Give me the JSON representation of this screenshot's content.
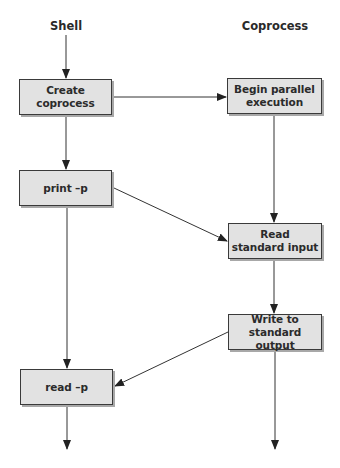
{
  "diagram": {
    "columns": [
      {
        "id": "shell",
        "label": "Shell"
      },
      {
        "id": "coprocess",
        "label": "Coprocess"
      }
    ],
    "nodes": [
      {
        "id": "create",
        "column": "shell",
        "label": "Create\ncoprocess"
      },
      {
        "id": "begin",
        "column": "coprocess",
        "label": "Begin parallel\nexecution"
      },
      {
        "id": "print",
        "column": "shell",
        "label": "print –p"
      },
      {
        "id": "readin",
        "column": "coprocess",
        "label": "Read\nstandard input"
      },
      {
        "id": "writeout",
        "column": "coprocess",
        "label": "Write to\nstandard output"
      },
      {
        "id": "read",
        "column": "shell",
        "label": "read –p"
      }
    ],
    "edges": [
      {
        "from": "shell-start",
        "to": "create"
      },
      {
        "from": "create",
        "to": "begin"
      },
      {
        "from": "create",
        "to": "print"
      },
      {
        "from": "begin",
        "to": "readin"
      },
      {
        "from": "print",
        "to": "readin"
      },
      {
        "from": "print",
        "to": "read"
      },
      {
        "from": "readin",
        "to": "writeout"
      },
      {
        "from": "writeout",
        "to": "read"
      },
      {
        "from": "read",
        "to": "shell-end"
      },
      {
        "from": "writeout",
        "to": "coprocess-end"
      }
    ],
    "colors": {
      "box_fill": "#e2e2e2",
      "box_border": "#3a3a3a",
      "box_shadow": "#a8a8a8",
      "line": "#333333"
    }
  }
}
